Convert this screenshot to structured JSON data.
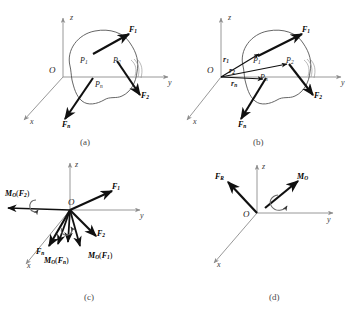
{
  "figure": {
    "kind": "mechanics-force-system-reduction-figure",
    "panel_count": 4
  },
  "panels": [
    {
      "id": "a",
      "caption": "(a)",
      "origin_label": "O",
      "axes": [
        {
          "name": "z-axis",
          "label": "z"
        },
        {
          "name": "y-axis",
          "label": "y"
        },
        {
          "name": "x-axis",
          "label": "x"
        }
      ],
      "points": [
        {
          "name": "point-P1",
          "label": "P",
          "sub": "1"
        },
        {
          "name": "point-P2",
          "label": "P",
          "sub": "2"
        },
        {
          "name": "point-Pn",
          "label": "P",
          "sub": "n"
        }
      ],
      "forces": [
        {
          "name": "force-F1",
          "label": "F",
          "sub": "1"
        },
        {
          "name": "force-F2",
          "label": "F",
          "sub": "2"
        },
        {
          "name": "force-Fn",
          "label": "F",
          "sub": "n"
        }
      ]
    },
    {
      "id": "b",
      "caption": "(b)",
      "origin_label": "O",
      "axes": [
        {
          "name": "z-axis",
          "label": "z"
        },
        {
          "name": "y-axis",
          "label": "y"
        },
        {
          "name": "x-axis",
          "label": "x"
        }
      ],
      "points": [
        {
          "name": "point-P1",
          "label": "P",
          "sub": "1"
        },
        {
          "name": "point-P2",
          "label": "P",
          "sub": "2"
        },
        {
          "name": "point-Pn",
          "label": "P",
          "sub": "n"
        }
      ],
      "forces": [
        {
          "name": "force-F1",
          "label": "F",
          "sub": "1"
        },
        {
          "name": "force-F2",
          "label": "F",
          "sub": "2"
        },
        {
          "name": "force-Fn",
          "label": "F",
          "sub": "n"
        }
      ],
      "position_vectors": [
        {
          "name": "position-vector-r1",
          "label": "r",
          "sub": "1"
        },
        {
          "name": "position-vector-r2",
          "label": "r",
          "sub": "2"
        },
        {
          "name": "position-vector-rn",
          "label": "r",
          "sub": "n"
        }
      ]
    },
    {
      "id": "c",
      "caption": "(c)",
      "origin_label": "O",
      "axes": [
        {
          "name": "z-axis",
          "label": "z"
        },
        {
          "name": "y-axis",
          "label": "y"
        },
        {
          "name": "x-axis",
          "label": "x"
        }
      ],
      "forces": [
        {
          "name": "force-F1",
          "label": "F",
          "sub": "1"
        },
        {
          "name": "force-F2",
          "label": "F",
          "sub": "2"
        },
        {
          "name": "force-Fn",
          "label": "F",
          "sub": "n"
        }
      ],
      "moments": [
        {
          "name": "moment-of-F1-about-O",
          "main": "M",
          "sub": "O",
          "arg_main": "F",
          "arg_sub": "1"
        },
        {
          "name": "moment-of-F2-about-O",
          "main": "M",
          "sub": "O",
          "arg_main": "F",
          "arg_sub": "2"
        },
        {
          "name": "moment-of-Fn-about-O",
          "main": "M",
          "sub": "O",
          "arg_main": "F",
          "arg_sub": "n"
        }
      ]
    },
    {
      "id": "d",
      "caption": "(d)",
      "origin_label": "O",
      "axes": [
        {
          "name": "z-axis",
          "label": "z"
        },
        {
          "name": "y-axis",
          "label": "y"
        },
        {
          "name": "x-axis",
          "label": "x"
        }
      ],
      "resultant_force": {
        "name": "resultant-force-FR",
        "label": "F",
        "sub": "R"
      },
      "resultant_moment": {
        "name": "resultant-moment-MO",
        "label": "M",
        "sub": "O"
      }
    }
  ],
  "colors": {
    "axis": "#8c8c8c",
    "vector": "#101010",
    "body_outline": "#555555",
    "caption": "#4a4a4a",
    "background": "#ffffff"
  }
}
